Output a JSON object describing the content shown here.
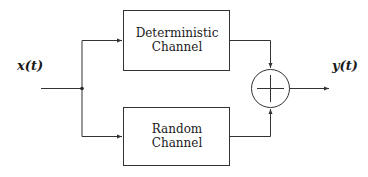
{
  "diagram": {
    "input_signal": "x(t)",
    "output_signal": "y(t)",
    "blocks": [
      {
        "line1": "Deterministic",
        "line2": "Channel"
      },
      {
        "line1": "Random",
        "line2": "Channel"
      }
    ],
    "summer": {
      "symbol": "plus",
      "type": "summing-junction"
    },
    "colors": {
      "stroke": "#333333",
      "background": "#ffffff"
    }
  }
}
